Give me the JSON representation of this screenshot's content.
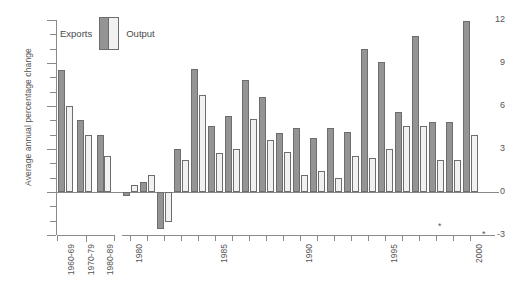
{
  "chart_data": {
    "type": "bar",
    "title": "",
    "xlabel": "",
    "ylabel": "Average annual percentage change",
    "ylim": [
      -3,
      12
    ],
    "yticks": [
      -3,
      0,
      3,
      6,
      9,
      12
    ],
    "ytick_labels": [
      "-3",
      "0",
      "3",
      "6",
      "9",
      "12"
    ],
    "grid": false,
    "legend_position": "top-left",
    "legend": [
      "Exports",
      "Output"
    ],
    "annotations": [
      "* forecast"
    ],
    "forecast_marker": "*",
    "axis_segments": [
      {
        "name": "decades",
        "categories": [
          "1960-69",
          "1970-79",
          "1980-89"
        ]
      },
      {
        "name": "years",
        "categories": [
          "1980",
          "1981",
          "1982",
          "1983",
          "1984",
          "1985",
          "1986",
          "1987",
          "1988",
          "1989",
          "1990",
          "1991",
          "1992",
          "1993",
          "1994",
          "1995",
          "1996",
          "1997",
          "1998",
          "1999",
          "2000"
        ],
        "tick_labels_shown": [
          "1980",
          "1985",
          "1990",
          "1995",
          "2000"
        ]
      }
    ],
    "categories": [
      "1960-69",
      "1970-79",
      "1980-89",
      "1980",
      "1981",
      "1982",
      "1983",
      "1984",
      "1985",
      "1986",
      "1987",
      "1988",
      "1989",
      "1990",
      "1991",
      "1992",
      "1993",
      "1994",
      "1995",
      "1996",
      "1997",
      "1998",
      "1999",
      "2000"
    ],
    "series": [
      {
        "name": "Exports",
        "color": "#949494",
        "values": [
          8.5,
          5.0,
          4.0,
          -0.3,
          0.7,
          -2.6,
          3.0,
          8.6,
          4.6,
          5.3,
          7.8,
          6.6,
          4.1,
          4.5,
          3.8,
          4.5,
          4.2,
          10.0,
          9.1,
          5.6,
          10.9,
          4.9,
          4.9,
          11.9
        ]
      },
      {
        "name": "Output",
        "color": "#f1f1f1",
        "values": [
          6.0,
          4.0,
          2.5,
          0.5,
          1.2,
          -2.1,
          2.2,
          6.8,
          2.7,
          3.0,
          5.1,
          3.6,
          2.8,
          1.2,
          1.5,
          1.0,
          2.5,
          2.4,
          3.0,
          4.6,
          4.6,
          2.2,
          2.2,
          4.0
        ]
      }
    ]
  }
}
